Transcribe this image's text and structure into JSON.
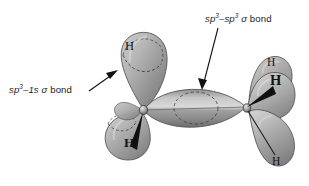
{
  "figure": {
    "background_color": "#ffffff",
    "orbital_fill_light": "#d8d8d8",
    "orbital_fill_mid": "#a8a8a8",
    "orbital_fill_dark": "#6f6f6f",
    "outline_color": "#4a4a4a",
    "dashed_color": "#3a3a3a",
    "text_color": "#1a1a1a",
    "wedge_color": "#101010"
  },
  "annotations": {
    "sp3_1s": {
      "full_text": "sp3–1s σ bond",
      "orbital": "sp",
      "exponent": "3",
      "dash": "–",
      "partner": "1s",
      "sigma": "σ",
      "bond_word": "bond"
    },
    "sp3_sp3": {
      "full_text": "sp3–sp3 σ bond",
      "orbital": "sp",
      "exponent": "3",
      "dash": "–",
      "orbital2": "sp",
      "exponent2": "3",
      "sigma": "σ",
      "bond_word": "bond"
    }
  },
  "atoms": {
    "hydrogens": [
      {
        "id": "h-upper-left",
        "label": "H",
        "bond_style": "plain"
      },
      {
        "id": "h-lower-left",
        "label": "H",
        "bond_style": "wedge"
      },
      {
        "id": "h-upper-right",
        "label": "H",
        "bond_style": "plain"
      },
      {
        "id": "h-mid-right",
        "label": "H",
        "bond_style": "wedge"
      },
      {
        "id": "h-lower-right",
        "label": "H",
        "bond_style": "line"
      }
    ],
    "carbons": [
      {
        "id": "carbon-left",
        "label": ""
      },
      {
        "id": "carbon-right",
        "label": ""
      }
    ]
  }
}
